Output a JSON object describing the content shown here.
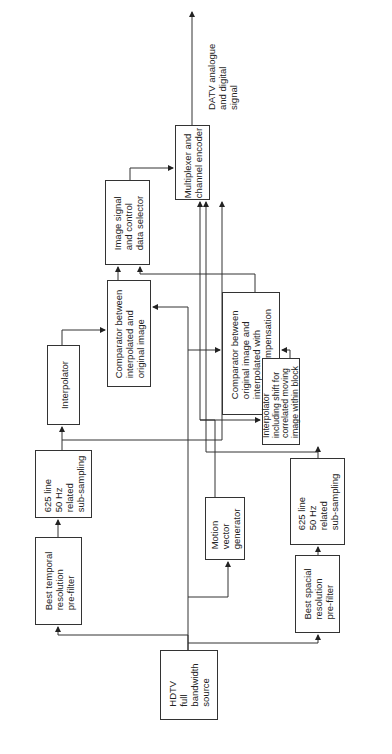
{
  "diagram": {
    "type": "block-diagram",
    "orientation": "rotated-90-ccw",
    "output_label": "DATV analogue\nand digital\nsignal",
    "blocks": {
      "hdtv_source": "HDTV\nfull\nbandwidth\nsource",
      "best_temporal": "Best temporal\nresolution\npre-filter",
      "subsampling_625_a": "625 line\n50 Hz\nrelated\nsub-sampling",
      "interpolator": "Interpolator",
      "comparator_a": "Comparator between\ninterpolated and\noriginal image",
      "selector": "Image signal\nand control\ndata selector",
      "multiplexer": "Multiplexer and\nchannel encoder",
      "comparator_b": "Comparator between\noriginal image and\ninterpolated with\nmotion compensation",
      "interpolator_shift": "Interpolator\nincluding shift for\ncorrelated moving\nimage within block",
      "subsampling_625_b": "625 line\n50 Hz\nrelated\nsub-sampling",
      "best_spacial": "Best spacial\nresolution\npre-filter",
      "motion_vector": "Motion\nvector\ngenerator"
    }
  }
}
